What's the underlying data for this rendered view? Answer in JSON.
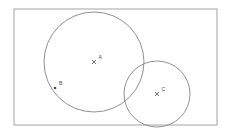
{
  "figure": {
    "background_color": "#ffffff",
    "stroke_color": "#8c8c8c",
    "label_color": "#4a4a4a",
    "canvas": {
      "width": 227,
      "height": 134
    }
  },
  "rectangle": {
    "name": "bounding-rectangle",
    "x": 14,
    "y": 9,
    "width": 203,
    "height": 116,
    "stroke": "#9a9a9a",
    "stroke_width": 0.9,
    "fill": "none"
  },
  "circles": [
    {
      "name": "circle-a",
      "label": "A",
      "cx": 94,
      "cy": 62,
      "r": 50,
      "stroke": "#7d7d7d",
      "stroke_width": 0.85,
      "fill": "none"
    },
    {
      "name": "circle-c",
      "label": "C",
      "cx": 157,
      "cy": 94,
      "r": 33,
      "stroke": "#7d7d7d",
      "stroke_width": 0.85,
      "fill": "none"
    }
  ],
  "points": [
    {
      "name": "point-a",
      "label": "A",
      "x": 94,
      "y": 62,
      "marker": "cross",
      "label_dx": 4.5,
      "label_dy": -3.2,
      "description": "center of large circle"
    },
    {
      "name": "point-b",
      "label": "B",
      "x": 55,
      "y": 88,
      "marker": "dot",
      "label_dx": 4.0,
      "label_dy": -3.0,
      "description": "point on circumference of large circle"
    },
    {
      "name": "point-c",
      "label": "C",
      "x": 157,
      "y": 94,
      "marker": "cross",
      "label_dx": 4.5,
      "label_dy": -3.2,
      "description": "center of small circle"
    }
  ]
}
